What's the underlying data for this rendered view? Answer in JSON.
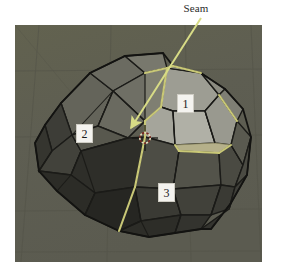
{
  "figure": {
    "kind": "blender-3d-viewport-screenshot",
    "page_background": "#ffffff"
  },
  "annotation": {
    "seam_label": "Seam",
    "arrow": {
      "name": "seam-arrow",
      "color": "#d8dc86",
      "start_x": 201,
      "start_y": 18,
      "end_x": 128,
      "end_y": 131
    }
  },
  "callouts": [
    {
      "id": "1",
      "label": "1",
      "x": 177,
      "y": 94
    },
    {
      "id": "2",
      "label": "2",
      "x": 76,
      "y": 124
    },
    {
      "id": "3",
      "label": "3",
      "x": 158,
      "y": 183
    }
  ],
  "viewport": {
    "x": 15,
    "y": 25,
    "width": 247,
    "height": 237,
    "background_color": "#5f5f53",
    "grid_color": "#55554a",
    "object_name": "icosphere",
    "wireframe_color": "#1b1b18",
    "seam_edge_color": "#c9c877",
    "cursor": {
      "name": "3d-cursor",
      "x": 145,
      "y": 138,
      "ring_color": "#d8d2b4",
      "cross_color": "#1a1a18"
    },
    "shading": {
      "lit_face_color": "#9a9a90",
      "lit_face_highlight": "#a9a99e",
      "mid_face_color": "#6d6d63",
      "shadow_face_color": "#3b3b35",
      "dark_face_color": "#2a2a26",
      "seam_band_color": "#b9b58a"
    }
  }
}
